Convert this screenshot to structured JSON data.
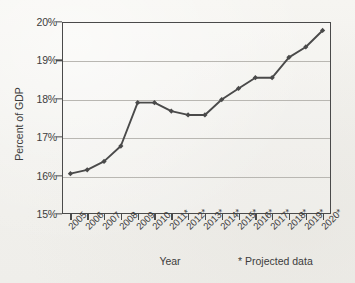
{
  "chart_data": {
    "type": "line",
    "title": "",
    "xlabel": "Year",
    "ylabel": "Percent of GDP",
    "categories": [
      "2005",
      "2006",
      "2007",
      "2008",
      "2009",
      "2010",
      "2011*",
      "2012*",
      "2013*",
      "2014*",
      "2015*",
      "2016*",
      "2017*",
      "2018*",
      "2019*",
      "2020*"
    ],
    "values": [
      16.05,
      16.15,
      16.37,
      16.77,
      17.9,
      17.9,
      17.68,
      17.58,
      17.58,
      17.98,
      18.27,
      18.55,
      18.55,
      19.08,
      19.35,
      19.78
    ],
    "series": [
      {
        "name": "Percent of GDP",
        "values": [
          16.05,
          16.15,
          16.37,
          16.77,
          17.9,
          17.9,
          17.68,
          17.58,
          17.58,
          17.98,
          18.27,
          18.55,
          18.55,
          19.08,
          19.35,
          19.78
        ]
      }
    ],
    "ylim": [
      15,
      20
    ],
    "yticks": [
      15,
      16,
      17,
      18,
      19,
      20
    ],
    "ytick_labels": [
      "15%",
      "16%",
      "17%",
      "18%",
      "19%",
      "20%"
    ],
    "grid": true,
    "legend": "none",
    "annotations": [
      "* Projected data"
    ],
    "marker": "diamond",
    "line_color": "#4a4a4a",
    "grid_color": "#b9b7b2",
    "axis_color": "#4a4a4a"
  },
  "axes": {
    "y_title": "Percent of GDP",
    "x_title": "Year"
  },
  "footnote": {
    "text": "* Projected data"
  }
}
